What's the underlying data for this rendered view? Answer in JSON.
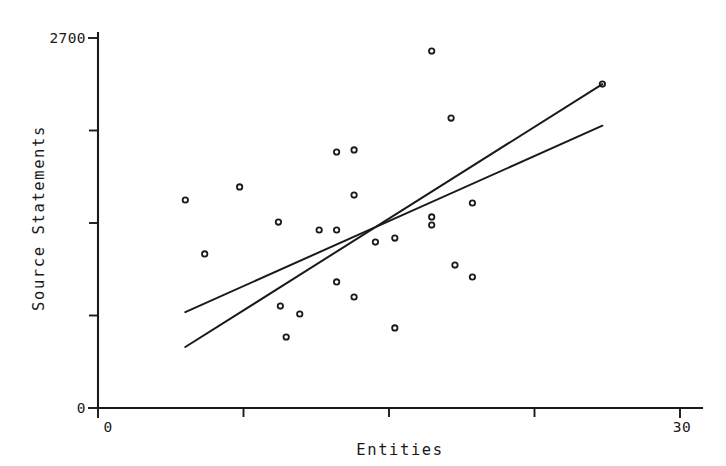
{
  "chart_data": {
    "type": "scatter",
    "title": "",
    "subtitle": "",
    "xlabel": "Entities",
    "ylabel": "Source Statements",
    "xlim": [
      0,
      30
    ],
    "ylim": [
      0,
      2700
    ],
    "grid": false,
    "legend": null,
    "legend_position": "none",
    "x_tick_labels": [
      "0",
      "30"
    ],
    "x_tick_values": [
      0,
      30
    ],
    "x_minor_tick_values": [
      7.5,
      15,
      22.5
    ],
    "y_tick_labels": [
      "0",
      "2700"
    ],
    "y_tick_values": [
      0,
      2700
    ],
    "y_minor_tick_values": [
      675,
      1350,
      2025
    ],
    "marker_style": "open-circle",
    "points": [
      {
        "x": 4.5,
        "y": 1518
      },
      {
        "x": 5.5,
        "y": 1124
      },
      {
        "x": 7.3,
        "y": 1613
      },
      {
        "x": 9.3,
        "y": 1357
      },
      {
        "x": 9.4,
        "y": 744
      },
      {
        "x": 9.7,
        "y": 518
      },
      {
        "x": 10.4,
        "y": 686
      },
      {
        "x": 11.4,
        "y": 1299
      },
      {
        "x": 12.3,
        "y": 1868
      },
      {
        "x": 12.3,
        "y": 1299
      },
      {
        "x": 12.3,
        "y": 920
      },
      {
        "x": 13.2,
        "y": 1883
      },
      {
        "x": 13.2,
        "y": 1554
      },
      {
        "x": 13.2,
        "y": 810
      },
      {
        "x": 14.3,
        "y": 1211
      },
      {
        "x": 15.3,
        "y": 1240
      },
      {
        "x": 15.3,
        "y": 584
      },
      {
        "x": 17.2,
        "y": 2605
      },
      {
        "x": 17.2,
        "y": 1394
      },
      {
        "x": 17.2,
        "y": 1335
      },
      {
        "x": 18.2,
        "y": 2116
      },
      {
        "x": 18.4,
        "y": 1043
      },
      {
        "x": 19.3,
        "y": 1496
      },
      {
        "x": 19.3,
        "y": 956
      },
      {
        "x": 26.0,
        "y": 2364
      }
    ],
    "fit_lines": [
      {
        "name": "shallow-fit",
        "x_start": 4.5,
        "y_start": 700,
        "x_end": 26.0,
        "y_end": 2060
      },
      {
        "name": "steep-fit",
        "x_start": 4.5,
        "y_start": 445,
        "x_end": 26.0,
        "y_end": 2364
      }
    ]
  },
  "axes": {
    "x": {
      "label": "Entities",
      "min_label": "0",
      "max_label": "30"
    },
    "y": {
      "label": "Source Statements",
      "min_label": "0",
      "max_label": "2700"
    }
  }
}
